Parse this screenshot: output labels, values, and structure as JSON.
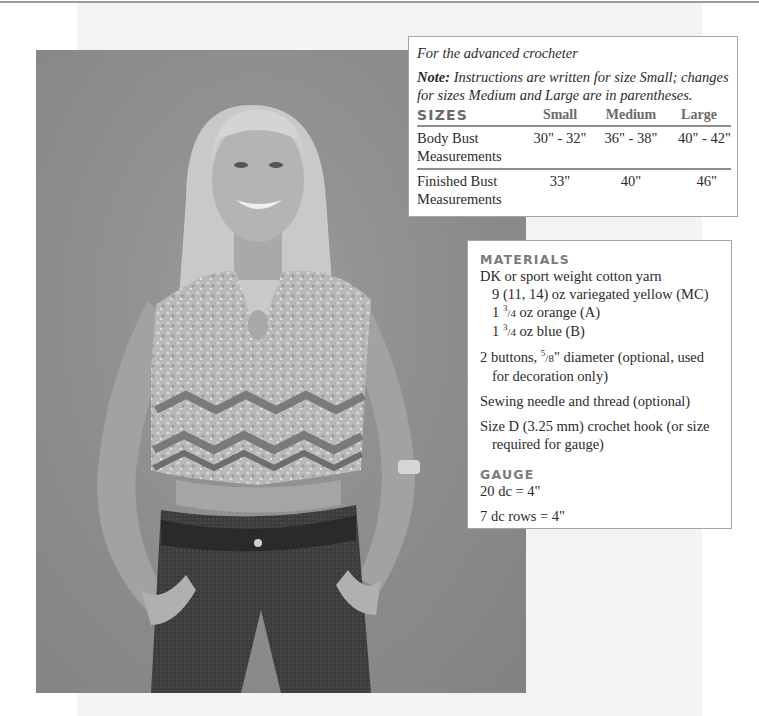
{
  "page": {
    "photo_alt": "Model wearing crocheted chevron-striped cap-sleeve top with keyhole neckline, jeans and belt"
  },
  "sizes_box": {
    "intro": "For the advanced crocheter",
    "note_label": "Note:",
    "note_text": " Instructions are written for size Small; changes for sizes Medium and Large are in parentheses.",
    "table": {
      "headers": [
        "SIZES",
        "Small",
        "Medium",
        "Large"
      ],
      "rows": [
        {
          "label": "Body Bust Measurements",
          "small": "30\" - 32\"",
          "medium": "36\" - 38\"",
          "large": "40\" - 42\""
        },
        {
          "label": "Finished Bust Measurements",
          "small": "33\"",
          "medium": "40\"",
          "large": "46\""
        }
      ]
    }
  },
  "materials_box": {
    "heading": "MATERIALS",
    "yarn": "DK or sport weight cotton yarn",
    "yarn_mc": "9 (11, 14) oz variegated yellow (MC)",
    "yarn_a_whole": "1 ",
    "yarn_a_num": "3",
    "yarn_a_den": "/4",
    "yarn_a_rest": " oz orange (A)",
    "yarn_b_whole": "1 ",
    "yarn_b_num": "3",
    "yarn_b_den": "/4",
    "yarn_b_rest": " oz blue (B)",
    "buttons_pre": "2 buttons, ",
    "buttons_num": "5",
    "buttons_den": "/8",
    "buttons_post": "\" diameter (optional, used for decoration only)",
    "sewing": "Sewing needle and thread (optional)",
    "hook": "Size D (3.25 mm) crochet hook (or size required for gauge)",
    "gauge_heading": "GAUGE",
    "gauge_stitches": "20 dc = 4\"",
    "gauge_rows": "7 dc rows = 4\""
  },
  "colors": {
    "heading_gray": "#7c7c7c",
    "rule_gray": "#8e8e8e",
    "photo_backdrop": "#8c8c8c",
    "panel_bg": "#f3f3f3"
  }
}
